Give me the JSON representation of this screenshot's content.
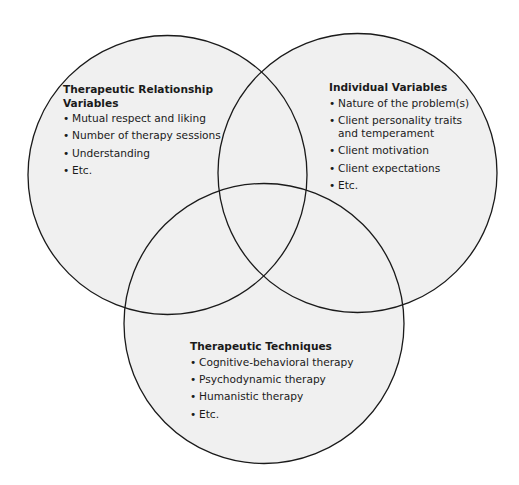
{
  "diagram": {
    "type": "venn",
    "colors": {
      "fill": "#f0f0f0",
      "stroke": "#1a1a1a",
      "background": "#ffffff"
    },
    "circles": [
      {
        "id": "relationship",
        "title": "Therapeutic Relationship Variables",
        "items": [
          "Mutual respect and liking",
          "Number of therapy sessions",
          "Understanding",
          "Etc."
        ]
      },
      {
        "id": "individual",
        "title": "Individual Variables",
        "items": [
          "Nature of the problem(s)",
          "Client personality traits and temperament",
          "Client motivation",
          "Client expectations",
          "Etc."
        ]
      },
      {
        "id": "techniques",
        "title": "Therapeutic Techniques",
        "items": [
          "Cognitive-behavioral therapy",
          "Psychodynamic therapy",
          "Humanistic therapy",
          "Etc."
        ]
      }
    ]
  }
}
